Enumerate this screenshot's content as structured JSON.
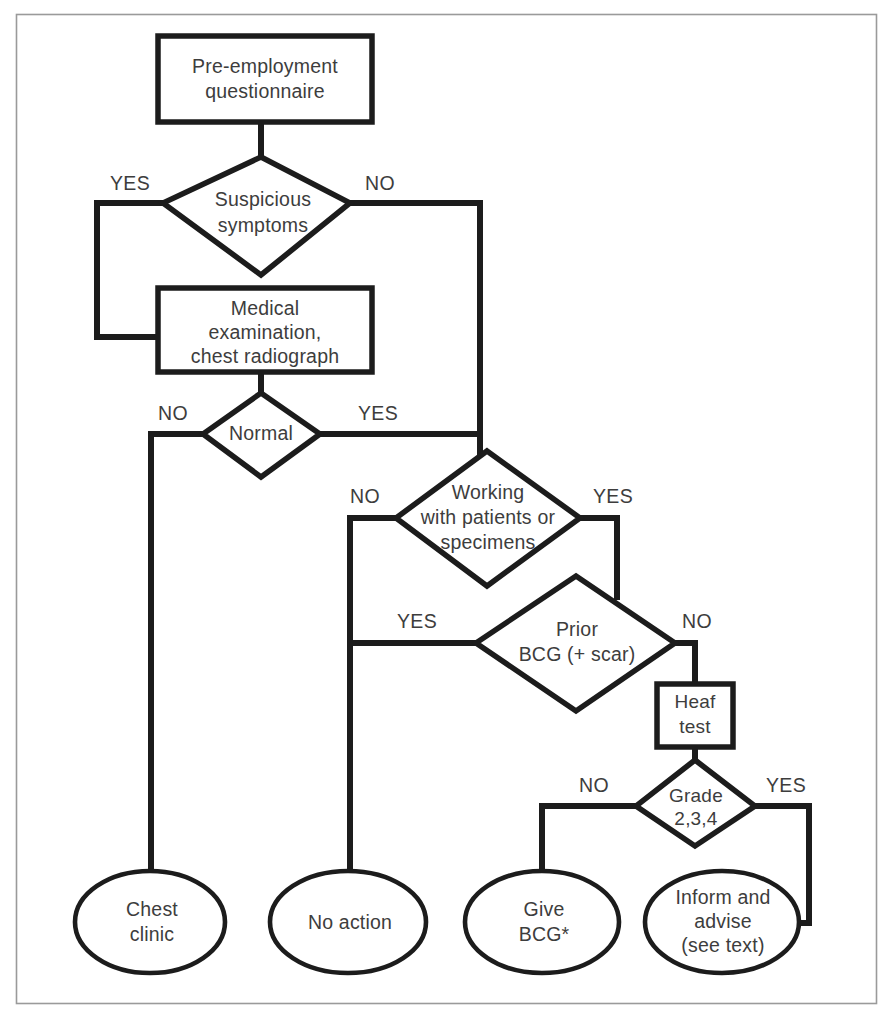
{
  "diagram": {
    "frame": {
      "stroke_color": "#9a9a9a"
    },
    "colors": {
      "shape_stroke": "#1c1c1c",
      "shape_fill": "#ffffff",
      "text": "#3d3d3d",
      "connector": "#1c1c1c",
      "background": "#ffffff"
    },
    "nodes": [
      {
        "id": "pre-employment-questionnaire",
        "shape": "rectangle",
        "lines": [
          "Pre-employment",
          "questionnaire"
        ]
      },
      {
        "id": "suspicious-symptoms",
        "shape": "diamond",
        "lines": [
          "Suspicious",
          "symptoms"
        ]
      },
      {
        "id": "medical-examination",
        "shape": "rectangle",
        "lines": [
          "Medical",
          "examination,",
          "chest radiograph"
        ]
      },
      {
        "id": "normal",
        "shape": "diamond",
        "lines": [
          "Normal"
        ]
      },
      {
        "id": "working-with-patients",
        "shape": "diamond",
        "lines": [
          "Working",
          "with patients or",
          "specimens"
        ]
      },
      {
        "id": "prior-bcg",
        "shape": "diamond",
        "lines": [
          "Prior",
          "BCG (+ scar)"
        ]
      },
      {
        "id": "heaf-test",
        "shape": "rectangle",
        "lines": [
          "Heaf",
          "test"
        ]
      },
      {
        "id": "grade-234",
        "shape": "diamond",
        "lines": [
          "Grade",
          "2,3,4"
        ]
      },
      {
        "id": "chest-clinic",
        "shape": "ellipse",
        "lines": [
          "Chest",
          "clinic"
        ]
      },
      {
        "id": "no-action",
        "shape": "ellipse",
        "lines": [
          "No action"
        ]
      },
      {
        "id": "give-bcg",
        "shape": "ellipse",
        "lines": [
          "Give",
          "BCG*"
        ]
      },
      {
        "id": "inform-and-advise",
        "shape": "ellipse",
        "lines": [
          "Inform and",
          "advise",
          "(see text)"
        ]
      }
    ],
    "edge_labels": [
      {
        "id": "suspicious-yes",
        "text": "YES"
      },
      {
        "id": "suspicious-no",
        "text": "NO"
      },
      {
        "id": "normal-no",
        "text": "NO"
      },
      {
        "id": "normal-yes",
        "text": "YES"
      },
      {
        "id": "working-no",
        "text": "NO"
      },
      {
        "id": "working-yes",
        "text": "YES"
      },
      {
        "id": "bcg-yes",
        "text": "YES"
      },
      {
        "id": "bcg-no",
        "text": "NO"
      },
      {
        "id": "grade-no",
        "text": "NO"
      },
      {
        "id": "grade-yes",
        "text": "YES"
      }
    ]
  }
}
